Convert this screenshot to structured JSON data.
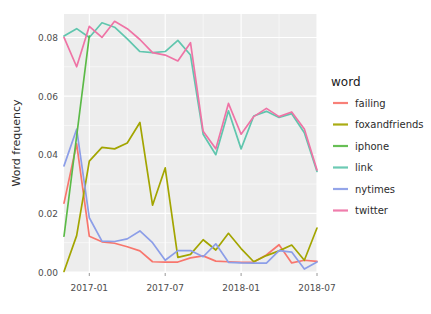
{
  "chart_data": {
    "type": "line",
    "title": "",
    "subtitle": "",
    "xlabel": "",
    "ylabel": "Word frequency",
    "legend_title": "word",
    "legend_position": "right",
    "grid": true,
    "xlim": [
      "2016-11",
      "2018-08"
    ],
    "ylim": [
      0.0,
      0.088
    ],
    "x_tick_labels": [
      "2017-01",
      "2017-07",
      "2018-01",
      "2018-07"
    ],
    "x_tick_values": [
      "2017-01",
      "2017-07",
      "2018-01",
      "2018-07"
    ],
    "y_tick_labels": [
      "0.00",
      "0.02",
      "0.04",
      "0.06",
      "0.08"
    ],
    "y_tick_values": [
      0.0,
      0.02,
      0.04,
      0.06,
      0.08
    ],
    "x": [
      "2016-11",
      "2016-12",
      "2017-01",
      "2017-02",
      "2017-03",
      "2017-04",
      "2017-05",
      "2017-06",
      "2017-07",
      "2017-08",
      "2017-09",
      "2017-10",
      "2017-11",
      "2017-12",
      "2018-01",
      "2018-02",
      "2018-03",
      "2018-04",
      "2018-05",
      "2018-06",
      "2018-07"
    ],
    "series": [
      {
        "name": "failing",
        "color": "#F8766D",
        "values": [
          0.0235,
          0.0437,
          0.0122,
          0.0103,
          0.0098,
          0.0086,
          0.0072,
          0.0035,
          0.0034,
          0.0034,
          0.0048,
          0.0055,
          0.0037,
          0.0035,
          0.0033,
          0.0034,
          0.0058,
          0.0093,
          0.0031,
          0.004,
          0.0036
        ]
      },
      {
        "name": "foxandfriends",
        "color": "#A3A500",
        "values": [
          0.0002,
          0.0124,
          0.0378,
          0.0425,
          0.042,
          0.044,
          0.051,
          0.0228,
          0.0355,
          0.005,
          0.006,
          0.011,
          0.0075,
          0.0132,
          0.008,
          0.0035,
          0.0056,
          0.0072,
          0.0092,
          0.004,
          0.015
        ]
      },
      {
        "name": "iphone",
        "color": "#5BBA47"
      },
      {
        "name": "link",
        "color": "#60C6AE",
        "values": [
          0.0805,
          0.083,
          0.08,
          0.085,
          0.0835,
          0.0795,
          0.0752,
          0.0748,
          0.0752,
          0.079,
          0.074,
          0.047,
          0.04,
          0.055,
          0.042,
          0.0532,
          0.0548,
          0.0527,
          0.054,
          0.0475,
          0.0343
        ]
      },
      {
        "name": "nytimes",
        "color": "#8C9EE8",
        "values": [
          0.0362,
          0.0487,
          0.0185,
          0.0105,
          0.0104,
          0.0113,
          0.014,
          0.01,
          0.004,
          0.0073,
          0.0073,
          0.0052,
          0.0096,
          0.0033,
          0.0031,
          0.003,
          0.003,
          0.0073,
          0.0068,
          0.001,
          0.0034
        ]
      },
      {
        "name": "twitter",
        "color": "#EF73A5",
        "values": [
          0.08,
          0.07,
          0.0838,
          0.08,
          0.0855,
          0.083,
          0.0793,
          0.0748,
          0.074,
          0.072,
          0.0782,
          0.048,
          0.042,
          0.0575,
          0.047,
          0.053,
          0.0558,
          0.053,
          0.0546,
          0.0488,
          0.0348
        ]
      }
    ],
    "iphone_segment": {
      "x_start": "2016-11",
      "x_end": "2017-01",
      "y_start": 0.0122,
      "y_end": 0.0805
    },
    "legend_items": [
      {
        "label": "failing",
        "color": "#F8766D"
      },
      {
        "label": "foxandfriends",
        "color": "#A3A500"
      },
      {
        "label": "iphone",
        "color": "#5BBA47"
      },
      {
        "label": "link",
        "color": "#60C6AE"
      },
      {
        "label": "nytimes",
        "color": "#8C9EE8"
      },
      {
        "label": "twitter",
        "color": "#EF73A5"
      }
    ],
    "panel": {
      "background": "#EBEBEB",
      "gridline_color": "#FFFFFF"
    }
  }
}
